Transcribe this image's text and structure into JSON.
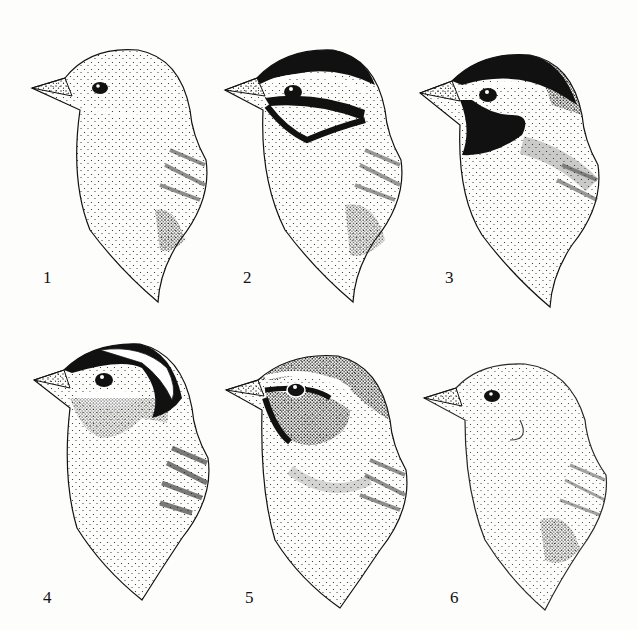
{
  "plate": {
    "description": "Stippled illustrations of six sparrow head plumage patterns",
    "background_color": "#fdfdfb",
    "ink_color": "#111111"
  },
  "figures": [
    {
      "label": "1",
      "pattern": "plain-stippled",
      "x": 20,
      "y": 10,
      "num_x": 43,
      "num_y": 270
    },
    {
      "label": "2",
      "pattern": "crown-stripes-and-cheek-outline",
      "x": 215,
      "y": 10,
      "num_x": 243,
      "num_y": 270
    },
    {
      "label": "3",
      "pattern": "black-crown-and-mask",
      "x": 410,
      "y": 10,
      "num_x": 445,
      "num_y": 270
    },
    {
      "label": "4",
      "pattern": "black-crown-band-white-cheek",
      "x": 22,
      "y": 330,
      "num_x": 43,
      "num_y": 590
    },
    {
      "label": "5",
      "pattern": "dark-eyestripe-grey-cheek",
      "x": 218,
      "y": 330,
      "num_x": 245,
      "num_y": 590
    },
    {
      "label": "6",
      "pattern": "pale-plain",
      "x": 415,
      "y": 330,
      "num_x": 450,
      "num_y": 590
    }
  ]
}
